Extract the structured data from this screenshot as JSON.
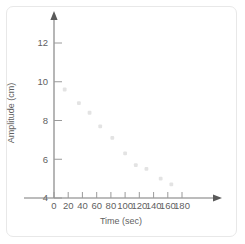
{
  "chart_data": {
    "type": "scatter",
    "title": "",
    "xlabel": "Time (sec)",
    "ylabel": "Amplitude (cm)",
    "xlim": [
      0,
      190
    ],
    "ylim": [
      3.2,
      12.8
    ],
    "xticks": [
      0,
      20,
      40,
      60,
      80,
      100,
      120,
      140,
      160,
      180
    ],
    "yticks": [
      4,
      6,
      8,
      10,
      12
    ],
    "grid": false,
    "legend": null,
    "marker_color": "#e3e3e3",
    "axis_color": "#7a7a7a",
    "x": [
      15,
      35,
      50,
      65,
      82,
      100,
      115,
      130,
      150,
      165
    ],
    "y": [
      9.6,
      8.9,
      8.4,
      7.7,
      7.1,
      6.3,
      5.7,
      5.5,
      5.0,
      4.7
    ],
    "points": [
      {
        "x": 15,
        "y": 9.6
      },
      {
        "x": 35,
        "y": 8.9
      },
      {
        "x": 50,
        "y": 8.4
      },
      {
        "x": 65,
        "y": 7.7
      },
      {
        "x": 82,
        "y": 7.1
      },
      {
        "x": 100,
        "y": 6.3
      },
      {
        "x": 115,
        "y": 5.7
      },
      {
        "x": 130,
        "y": 5.5
      },
      {
        "x": 150,
        "y": 5.0
      },
      {
        "x": 165,
        "y": 4.7
      }
    ]
  },
  "axes": {
    "x_tick_labels": [
      "0",
      "20",
      "40",
      "60",
      "80",
      "100",
      "120",
      "140",
      "160",
      "180"
    ],
    "y_tick_labels": [
      "4",
      "6",
      "8",
      "10",
      "12"
    ],
    "x_axis_title": "Time (sec)",
    "y_axis_title": "Amplitude (cm)"
  }
}
